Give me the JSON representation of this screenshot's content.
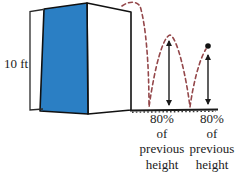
{
  "figure": {
    "type": "bouncing-ball-height-diagram",
    "building": {
      "height_label": "10 ft"
    },
    "bounce_labels": [
      {
        "lines": [
          "80%",
          "of",
          "previous",
          "height"
        ]
      },
      {
        "lines": [
          "80%",
          "of",
          "previous",
          "height"
        ]
      }
    ],
    "colors": {
      "building_face": "#2B7FC4",
      "building_edge": "#111111",
      "trajectory": "#94474A",
      "line": "#1A1A1A",
      "bracket": "#2A2A2A",
      "ball": "#111111"
    },
    "icons": {
      "ball": "filled-circle",
      "height_arrow": "double-headed-vertical-arrow",
      "trajectory_style": "dashed-bounce-arcs"
    }
  }
}
